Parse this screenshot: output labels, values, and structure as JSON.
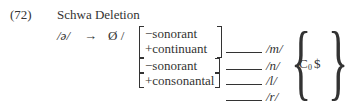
{
  "example": {
    "number": "(72)",
    "title": "Schwa Deletion"
  },
  "rule": {
    "input": "/ə/",
    "arrow": "→",
    "output": "Ø /",
    "contexts": [
      {
        "features": [
          "−sonorant",
          "+continuant"
        ],
        "target": "/m/"
      },
      {
        "features": [
          "−sonorant"
        ],
        "target": "/n/"
      },
      {
        "features": [
          "+consonantal"
        ],
        "target": "/l/"
      },
      {
        "features": [],
        "target": "/r/"
      }
    ],
    "right_context": {
      "C": "C",
      "subscript": "0",
      "boundary": "$"
    }
  }
}
